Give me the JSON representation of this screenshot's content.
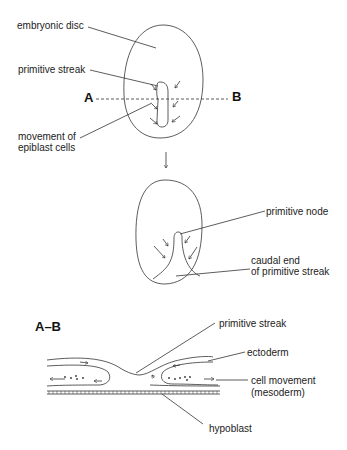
{
  "top_view": {
    "labels": {
      "embryonic_disc": "embryonic disc",
      "primitive_streak": "primitive streak",
      "point_a": "A",
      "point_b": "B",
      "movement_line1": "movement of",
      "movement_line2": "epiblast cells"
    }
  },
  "later_view": {
    "labels": {
      "primitive_node": "primitive node",
      "caudal_line1": "caudal end",
      "caudal_line2": "of primitive streak"
    }
  },
  "cross_section": {
    "title": "A–B",
    "labels": {
      "primitive_streak": "primitive streak",
      "ectoderm": "ectoderm",
      "cell_movement_line1": "cell movement",
      "cell_movement_line2": "(mesoderm)",
      "hypoblast": "hypoblast"
    }
  },
  "colors": {
    "line": "#333333",
    "text": "#222222",
    "background": "#ffffff"
  }
}
